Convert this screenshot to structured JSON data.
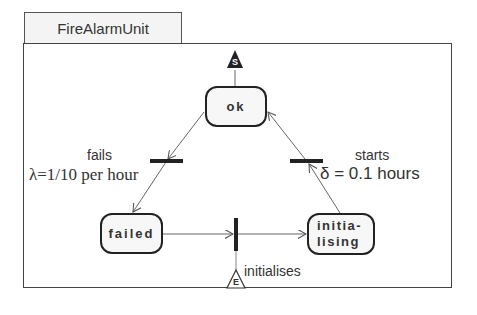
{
  "diagram": {
    "title": "FireAlarmUnit",
    "states": [
      {
        "id": "ok",
        "label": "ok"
      },
      {
        "id": "failed",
        "label": "failed"
      },
      {
        "id": "initialising",
        "label_line1": "initia-",
        "label_line2": "lising"
      }
    ],
    "transitions": [
      {
        "id": "fails",
        "label": "fails",
        "rate": "λ=1/10 per hour",
        "from": "ok",
        "to": "failed"
      },
      {
        "id": "starts",
        "label": "starts",
        "delay": "δ = 0.1 hours",
        "from": "initialising",
        "to": "ok"
      },
      {
        "id": "initialises",
        "label": "initialises",
        "from": "failed",
        "to": "initialising"
      }
    ],
    "markers": {
      "start": "S",
      "end": "E"
    },
    "colors": {
      "line": "#555555",
      "bar": "#222222",
      "state_border": "#222222",
      "state_fill": "#f7f7f7"
    }
  }
}
